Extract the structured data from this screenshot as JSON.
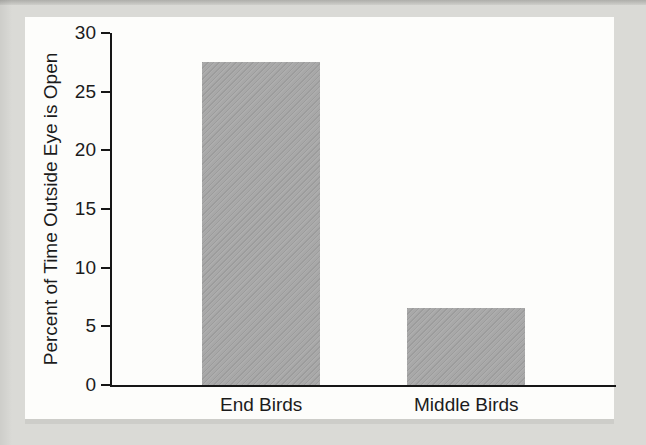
{
  "figure": {
    "background_color": "#dadad6",
    "panel_color": "#fdfdfb",
    "axis_color": "#161616",
    "text_color": "#1b1b1b",
    "bar_color": "#a8a8a8"
  },
  "chart_data": {
    "type": "bar",
    "title": "",
    "categories": [
      "End Birds",
      "Middle Birds"
    ],
    "values": [
      27.5,
      6.6
    ],
    "xlabel": "",
    "ylabel": "Percent of Time Outside Eye is Open",
    "ylim": [
      0,
      30
    ],
    "yticks": [
      0,
      5,
      10,
      15,
      20,
      25,
      30
    ],
    "ytick_labels": [
      "0",
      "5",
      "10",
      "15",
      "20",
      "25",
      "30"
    ],
    "grid": false,
    "legend": "none",
    "bar_texture": "diagonal-hatch"
  }
}
